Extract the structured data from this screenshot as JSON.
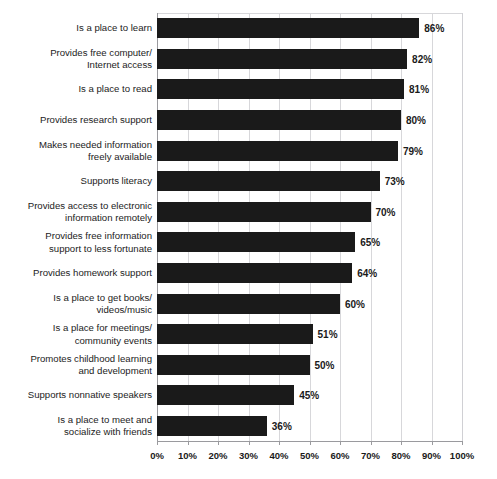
{
  "chart_data": {
    "type": "bar",
    "orientation": "horizontal",
    "title": "",
    "xlabel": "",
    "ylabel": "",
    "xlim": [
      0,
      100
    ],
    "xticks": [
      0,
      10,
      20,
      30,
      40,
      50,
      60,
      70,
      80,
      90,
      100
    ],
    "xtick_labels": [
      "0%",
      "10%",
      "20%",
      "30%",
      "40%",
      "50%",
      "60%",
      "70%",
      "80%",
      "90%",
      "100%"
    ],
    "grid": true,
    "legend": false,
    "bar_color": "#1a1a1a",
    "gridline_color": "#d7d7da",
    "axis_color": "#9a9a9e",
    "value_suffix": "%",
    "categories": [
      "Is a place to learn",
      "Provides free computer/\nInternet access",
      "Is a place to read",
      "Provides research support",
      "Makes needed information\nfreely available",
      "Supports literacy",
      "Provides access to electronic\ninformation remotely",
      "Provides free information\nsupport to less fortunate",
      "Provides homework support",
      "Is a place to get books/\nvideos/music",
      "Is a place for meetings/\ncommunity events",
      "Promotes childhood learning\nand development",
      "Supports nonnative speakers",
      "Is a place to meet and\nsocialize with friends"
    ],
    "values": [
      86,
      82,
      81,
      80,
      79,
      73,
      70,
      65,
      64,
      60,
      51,
      50,
      45,
      36
    ],
    "value_labels": [
      "86%",
      "82%",
      "81%",
      "80%",
      "79%",
      "73%",
      "70%",
      "65%",
      "64%",
      "60%",
      "51%",
      "50%",
      "45%",
      "36%"
    ]
  }
}
